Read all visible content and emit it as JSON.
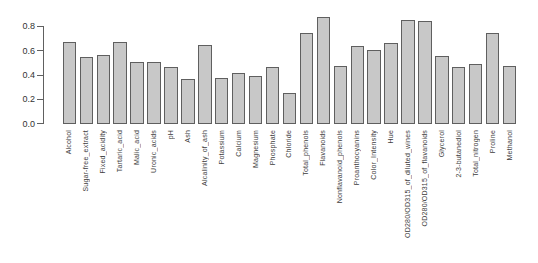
{
  "figure": {
    "background": "#ffffff",
    "bar_fill": "#c8c8c8",
    "bar_border": "#5f5f5f",
    "axis_color": "#606060",
    "tick_text_color": "#333333",
    "label_text_color": "#3d3d3d"
  },
  "chart_data": {
    "type": "bar",
    "title": "",
    "xlabel": "",
    "ylabel": "",
    "grid": false,
    "legend": false,
    "bar_orientation": "vertical",
    "x_tick_label_rotation": 90,
    "ylim": [
      0.0,
      0.8
    ],
    "yticks": [
      0.0,
      0.2,
      0.4,
      0.6,
      0.8
    ],
    "ytick_labels": [
      "0.0",
      "0.2",
      "0.4",
      "0.6",
      "0.8"
    ],
    "categories": [
      "Alcohol",
      "Sugar-free_extract",
      "Fixed_acidity",
      "Tartaric_acid",
      "Malic_acid",
      "Uronic_acids",
      "pH",
      "Ash",
      "Alcalinity_of_ash",
      "Potassium",
      "Calcium",
      "Magnesium",
      "Phosphate",
      "Chloride",
      "Total_phenols",
      "Flavanoids",
      "Nonflavanoid_phenols",
      "Proanthocyanins",
      "Color_Intensity",
      "Hue",
      "OD280/OD315_of_diluted_wines",
      "OD280/OD315_of_flavanoids",
      "Glycerol",
      "2-3-butanediol",
      "Total_nitrogen",
      "Proline",
      "Methanol"
    ],
    "values": [
      0.67,
      0.54,
      0.56,
      0.67,
      0.5,
      0.5,
      0.46,
      0.36,
      0.64,
      0.37,
      0.41,
      0.39,
      0.46,
      0.25,
      0.74,
      0.87,
      0.47,
      0.63,
      0.6,
      0.66,
      0.85,
      0.84,
      0.55,
      0.46,
      0.49,
      0.74,
      0.47
    ]
  }
}
